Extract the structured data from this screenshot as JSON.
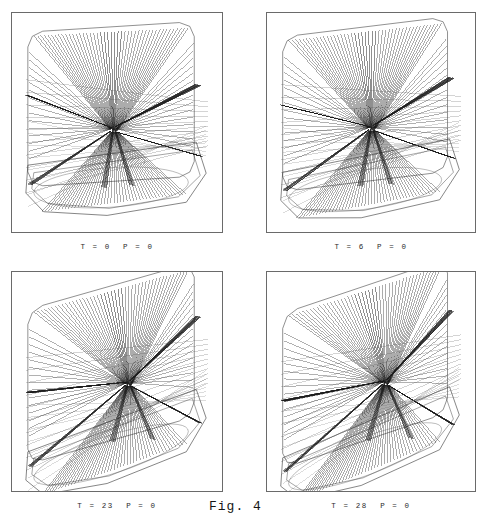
{
  "figure": {
    "label": "Fig. 4",
    "background_color": "#ffffff",
    "panel_border_color": "#6a6a6a",
    "ray_color": "#1a1a1a",
    "outline_color": "#333333"
  },
  "panels": [
    {
      "id": "panel-top-left",
      "caption": "T = 0  P = 0",
      "T": 0,
      "P": 0,
      "position": {
        "left": 11,
        "top": 12,
        "width": 212,
        "height": 221
      },
      "caption_position": {
        "left": 11,
        "top": 243,
        "width": 212
      }
    },
    {
      "id": "panel-top-right",
      "caption": "T = 6  P = 0",
      "T": 6,
      "P": 0,
      "position": {
        "left": 266,
        "top": 12,
        "width": 210,
        "height": 221
      },
      "caption_position": {
        "left": 266,
        "top": 243,
        "width": 210
      }
    },
    {
      "id": "panel-bottom-left",
      "caption": "T = 23  P = 0",
      "T": 23,
      "P": 0,
      "position": {
        "left": 11,
        "top": 271,
        "width": 212,
        "height": 221
      },
      "caption_position": {
        "left": 11,
        "top": 502,
        "width": 212
      }
    },
    {
      "id": "panel-bottom-right",
      "caption": "T = 28  P = 0",
      "T": 28,
      "P": 0,
      "position": {
        "left": 266,
        "top": 271,
        "width": 210,
        "height": 221
      },
      "caption_position": {
        "left": 266,
        "top": 502,
        "width": 210
      }
    }
  ],
  "fig_label_position": {
    "left": 209,
    "top": 499
  },
  "chart_data": {
    "type": "line",
    "title": "Fig. 4",
    "xlabel": "",
    "ylabel": "",
    "series": [
      {
        "name": "T = 0  P = 0",
        "values": [
          0,
          0
        ]
      },
      {
        "name": "T = 6  P = 0",
        "values": [
          6,
          0
        ]
      },
      {
        "name": "T = 23  P = 0",
        "values": [
          23,
          0
        ]
      },
      {
        "name": "T = 28  P = 0",
        "values": [
          28,
          0
        ]
      }
    ],
    "parameters": {
      "T": [
        0,
        6,
        23,
        28
      ],
      "P": [
        0,
        0,
        0,
        0
      ]
    },
    "legend_position": "below-each-panel",
    "grid": false,
    "ray_count_per_fan": 44,
    "panel_count": 4
  }
}
